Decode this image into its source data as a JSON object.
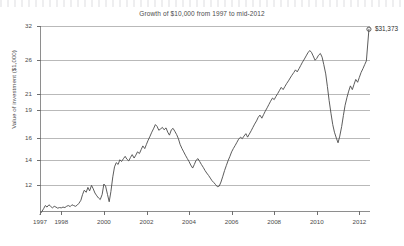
{
  "chart_data": {
    "type": "line",
    "title": "Growth of $10,000 from 1997 to mid-2012",
    "xlabel": "",
    "ylabel": "Value of investment ($1,000)",
    "y_scale": "log",
    "ylim": [
      10.2,
      32
    ],
    "xlim": [
      1997.0,
      2012.5
    ],
    "grid": true,
    "legend": false,
    "y_ticks": [
      12,
      14,
      16,
      19,
      21,
      26,
      32
    ],
    "y_tick_labels": [
      "12",
      "14",
      "16",
      "19",
      "21",
      "26",
      "32"
    ],
    "x_ticks": [
      1997,
      1998,
      2000,
      2002,
      2004,
      2006,
      2008,
      2010,
      2012
    ],
    "x_tick_labels": [
      "1997",
      "1998",
      "2000",
      "2002",
      "2004",
      "2006",
      "2008",
      "2010",
      "2012"
    ],
    "end_annotation": "$31,373",
    "end_point": {
      "x": 2012.45,
      "y": 31.373
    },
    "series": [
      {
        "name": "Value of investment",
        "color": "#4a4a4a",
        "x": [
          1997.0,
          1997.08,
          1997.17,
          1997.25,
          1997.33,
          1997.42,
          1997.5,
          1997.58,
          1997.67,
          1997.75,
          1997.83,
          1997.92,
          1998.0,
          1998.08,
          1998.17,
          1998.25,
          1998.33,
          1998.42,
          1998.5,
          1998.58,
          1998.67,
          1998.75,
          1998.83,
          1998.92,
          1999.0,
          1999.08,
          1999.17,
          1999.25,
          1999.33,
          1999.42,
          1999.5,
          1999.58,
          1999.67,
          1999.75,
          1999.83,
          1999.92,
          2000.0,
          2000.08,
          2000.17,
          2000.25,
          2000.33,
          2000.42,
          2000.5,
          2000.58,
          2000.67,
          2000.75,
          2000.83,
          2000.92,
          2001.0,
          2001.08,
          2001.17,
          2001.25,
          2001.33,
          2001.42,
          2001.5,
          2001.58,
          2001.67,
          2001.75,
          2001.83,
          2001.92,
          2002.0,
          2002.08,
          2002.17,
          2002.25,
          2002.33,
          2002.42,
          2002.5,
          2002.58,
          2002.67,
          2002.75,
          2002.83,
          2002.92,
          2003.0,
          2003.08,
          2003.17,
          2003.25,
          2003.33,
          2003.42,
          2003.5,
          2003.58,
          2003.67,
          2003.75,
          2003.83,
          2003.92,
          2004.0,
          2004.08,
          2004.17,
          2004.25,
          2004.33,
          2004.42,
          2004.5,
          2004.58,
          2004.67,
          2004.75,
          2004.83,
          2004.92,
          2005.0,
          2005.08,
          2005.17,
          2005.25,
          2005.33,
          2005.42,
          2005.5,
          2005.58,
          2005.67,
          2005.75,
          2005.83,
          2005.92,
          2006.0,
          2006.08,
          2006.17,
          2006.25,
          2006.33,
          2006.42,
          2006.5,
          2006.58,
          2006.67,
          2006.75,
          2006.83,
          2006.92,
          2007.0,
          2007.08,
          2007.17,
          2007.25,
          2007.33,
          2007.42,
          2007.5,
          2007.58,
          2007.67,
          2007.75,
          2007.83,
          2007.92,
          2008.0,
          2008.08,
          2008.17,
          2008.25,
          2008.33,
          2008.42,
          2008.5,
          2008.58,
          2008.67,
          2008.75,
          2008.83,
          2008.92,
          2009.0,
          2009.08,
          2009.17,
          2009.25,
          2009.33,
          2009.42,
          2009.5,
          2009.58,
          2009.67,
          2009.75,
          2009.83,
          2009.92,
          2010.0,
          2010.08,
          2010.17,
          2010.25,
          2010.33,
          2010.42,
          2010.5,
          2010.58,
          2010.67,
          2010.75,
          2010.83,
          2010.92,
          2011.0,
          2011.08,
          2011.17,
          2011.25,
          2011.33,
          2011.42,
          2011.5,
          2011.58,
          2011.67,
          2011.75,
          2011.83,
          2011.92,
          2012.0,
          2012.08,
          2012.17,
          2012.25,
          2012.33,
          2012.45
        ],
        "y": [
          10.0,
          10.15,
          10.35,
          10.55,
          10.45,
          10.6,
          10.5,
          10.4,
          10.5,
          10.45,
          10.38,
          10.42,
          10.4,
          10.45,
          10.42,
          10.5,
          10.55,
          10.48,
          10.6,
          10.55,
          10.5,
          10.58,
          10.7,
          10.9,
          11.3,
          11.6,
          11.45,
          11.8,
          11.55,
          11.95,
          11.7,
          11.4,
          11.2,
          11.05,
          10.95,
          11.3,
          12.05,
          11.9,
          11.3,
          10.8,
          11.5,
          12.6,
          13.4,
          13.75,
          13.6,
          14.0,
          13.85,
          14.1,
          14.3,
          14.05,
          13.9,
          14.2,
          14.45,
          14.15,
          14.4,
          14.7,
          14.55,
          14.9,
          15.25,
          15.0,
          15.4,
          15.8,
          16.2,
          16.6,
          16.95,
          17.4,
          17.2,
          16.8,
          16.95,
          17.1,
          16.85,
          17.05,
          16.6,
          16.3,
          16.85,
          17.0,
          16.7,
          16.35,
          15.95,
          15.4,
          15.0,
          14.7,
          14.4,
          14.1,
          13.85,
          13.55,
          13.3,
          13.6,
          13.95,
          14.1,
          13.85,
          13.6,
          13.35,
          13.1,
          12.9,
          12.7,
          12.5,
          12.3,
          12.15,
          12.0,
          11.85,
          11.9,
          12.2,
          12.6,
          13.1,
          13.5,
          13.9,
          14.3,
          14.7,
          15.0,
          15.3,
          15.6,
          15.9,
          16.1,
          15.95,
          16.2,
          16.45,
          16.1,
          16.4,
          16.75,
          17.1,
          17.45,
          17.8,
          18.2,
          18.45,
          18.1,
          18.5,
          18.9,
          19.3,
          19.7,
          20.1,
          20.5,
          20.3,
          20.7,
          21.1,
          21.5,
          21.9,
          21.6,
          22.0,
          22.4,
          22.8,
          23.2,
          23.6,
          24.0,
          24.4,
          24.1,
          24.6,
          25.1,
          25.6,
          26.1,
          26.6,
          27.1,
          27.5,
          27.2,
          26.6,
          25.9,
          26.2,
          26.7,
          27.0,
          26.4,
          25.2,
          23.8,
          22.0,
          20.2,
          18.6,
          17.4,
          16.6,
          16.0,
          15.55,
          16.2,
          17.2,
          18.4,
          19.6,
          20.6,
          21.4,
          22.1,
          21.6,
          22.3,
          23.0,
          22.6,
          23.3,
          24.0,
          24.6,
          25.2,
          25.8,
          31.373
        ]
      }
    ]
  }
}
